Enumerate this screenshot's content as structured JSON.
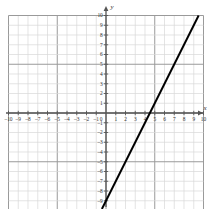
{
  "figure": {
    "title": "",
    "axis_labels": {
      "x": "x",
      "y": "y"
    }
  },
  "chart_data": {
    "type": "line",
    "title": "",
    "xlabel": "x",
    "ylabel": "y",
    "xlim": [
      -10,
      10
    ],
    "ylim": [
      -10,
      10
    ],
    "grid": true,
    "legend": "none",
    "x_ticks": [
      -10,
      -9,
      -8,
      -7,
      -6,
      -5,
      -4,
      -3,
      -2,
      -1,
      0,
      1,
      2,
      3,
      4,
      5,
      6,
      7,
      8,
      9,
      10
    ],
    "x_tick_labels": [
      "-10",
      "-9",
      "-8",
      "-7",
      "-6",
      "-5",
      "-4",
      "-3",
      "-2",
      "-1",
      "0",
      "1",
      "2",
      "3",
      "4",
      "5",
      "6",
      "7",
      "8",
      "9",
      "10"
    ],
    "y_ticks": [
      -9,
      -8,
      -7,
      -6,
      -5,
      -4,
      -3,
      -2,
      -1,
      0,
      1,
      2,
      3,
      4,
      5,
      6,
      7,
      8,
      9,
      10
    ],
    "y_tick_labels": [
      "-9",
      "-8",
      "-7",
      "-6",
      "-5",
      "-4",
      "-3",
      "-2",
      "-1",
      "0",
      "1",
      "2",
      "3",
      "4",
      "5",
      "6",
      "7",
      "8",
      "9",
      "10"
    ],
    "series": [
      {
        "name": "line",
        "kind": "straight-line",
        "slope": 2,
        "y_intercept": -9,
        "x_intercept": 4.5,
        "points": [
          [
            0,
            -9
          ],
          [
            4.5,
            0
          ],
          [
            9.5,
            10
          ]
        ],
        "color": "#000000",
        "width": 2
      }
    ],
    "colors": {
      "grid_minor": "#d9d9d9",
      "grid_major": "#9a9a9a",
      "axis": "#555555",
      "line": "#000000",
      "tick_text": "#333333",
      "background": "#ffffff"
    }
  }
}
